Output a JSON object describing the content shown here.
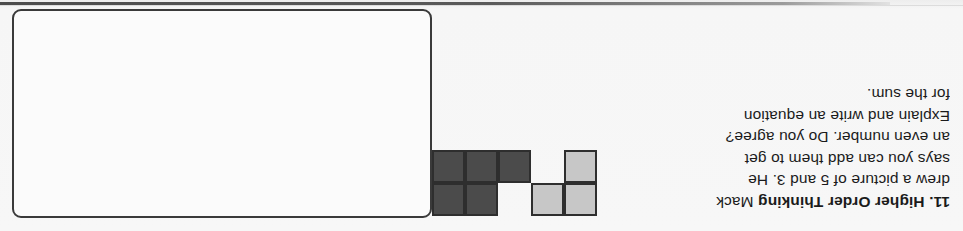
{
  "page": {
    "background_color": "#f7f7f7",
    "orientation_note": "upside-down-scan",
    "top_bar_color": "#4c4c4c"
  },
  "problem": {
    "number": "11.",
    "label": "Higher Order Thinking",
    "lines": [
      "Mack",
      "drew a picture of 5 and 3. He",
      "says you can add them to get",
      "an even number. Do you agree?",
      "Explain and write an equation",
      "for the sum."
    ],
    "full_text": "11. Higher Order Thinking Mack drew a picture of 5 and 3. He says you can add them to get an even number. Do you agree? Explain and write an equation for the sum.",
    "text_color": "#1b1b1b"
  },
  "diagram": {
    "name": "cube-train-diagram",
    "light_group": {
      "label": "light-cubes",
      "color": "#c7c7c7",
      "count": 3,
      "cells": [
        [
          0,
          0
        ],
        [
          1,
          0
        ],
        [
          0,
          1
        ]
      ]
    },
    "dark_group": {
      "label": "dark-cubes",
      "color": "#4b4b4b",
      "count": 5,
      "cells": [
        [
          3,
          0
        ],
        [
          4,
          0
        ],
        [
          2,
          1
        ],
        [
          3,
          1
        ],
        [
          4,
          1
        ]
      ]
    },
    "border_color": "#2e2e2e",
    "total_cubes": 8
  },
  "answer_box": {
    "name": "answer-work-area",
    "value": "",
    "placeholder": "",
    "border_color": "#3a3a3a",
    "fill_color": "#fbfbfb"
  }
}
